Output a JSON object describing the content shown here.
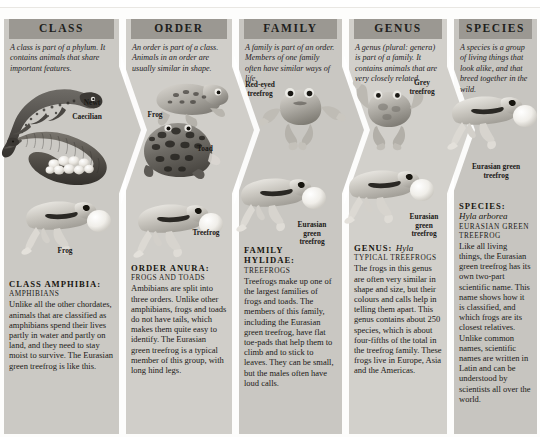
{
  "diagram": {
    "subject": "Eurasian green treefrog",
    "colors": {
      "header_bar": "#9b9892",
      "panel": "#cfcdc8",
      "page": "#fdfdfc",
      "text": "#1b1917"
    }
  },
  "columns": [
    {
      "id": "class",
      "header": "CLASS",
      "intro": "A class is part of a phylum. It contains animals that share important features.",
      "rank_head": "CLASS AMPHIBIA:",
      "common_name": "AMPHIBIANS",
      "scientific_name": "",
      "body": "Unlike all the other chordates, animals that are classified as amphibians spend their lives partly in water and partly on land, and they need to stay moist to survive. The Eurasian green treefrog is like this.",
      "figures": [
        {
          "label": "Newt",
          "kind": "newt-illustration"
        },
        {
          "label": "Caecilian",
          "kind": "caecilian-illustration"
        },
        {
          "label": "Frog",
          "kind": "frog-illustration"
        }
      ]
    },
    {
      "id": "order",
      "header": "ORDER",
      "intro": "An order is part of a class. Animals in an order are usually similar in shape.",
      "rank_head": "ORDER ANURA:",
      "common_name": "FROGS AND TOADS",
      "scientific_name": "",
      "body": "Ambibians are split into three orders. Unlike other amphibians, frogs and toads do not have tails, which makes them quite easy to identify. The Eurasian green treefrog is a typical member of this group, with long hind legs.",
      "figures": [
        {
          "label": "Frog",
          "kind": "frog-illustration"
        },
        {
          "label": "Toad",
          "kind": "toad-illustration"
        },
        {
          "label": "Treefrog",
          "kind": "treefrog-illustration"
        }
      ]
    },
    {
      "id": "family",
      "header": "FAMILY",
      "intro": "A family is part of an order. Members of one family often have similar ways of life.",
      "rank_head": "FAMILY HYLIDAE:",
      "common_name": "TREEFROGS",
      "scientific_name": "",
      "body": "Treefrogs make up one of the largest families of frogs and toads. The members of this family, including the Eurasian green treefrog, have flat toe-pads that help them to climb and to stick to leaves. They can be small, but the males often have loud calls.",
      "figures": [
        {
          "label": "Red-eyed\ntreefrog",
          "kind": "redeyed-treefrog-illustration"
        },
        {
          "label": "Eurasian\ngreen\ntreefrog",
          "kind": "treefrog-illustration"
        }
      ]
    },
    {
      "id": "genus",
      "header": "GENUS",
      "intro": "A genus (plural: genera) is part of a family. It contains animals that are very closely related.",
      "rank_head": "GENUS:",
      "scientific_name": "Hyla",
      "common_name": "TYPICAL TREEFROGS",
      "body": "The frogs in this genus are often very similar in shape and size, but their colours and calls help in telling them apart. This genus contains about 250 species, which is about four-fifths of the total in the treefrog family. These frogs live in Europe, Asia and the Americas.",
      "figures": [
        {
          "label": "Grey\ntreefrog",
          "kind": "grey-treefrog-illustration"
        },
        {
          "label": "Eurasian\ngreen\ntreefrog",
          "kind": "treefrog-illustration"
        }
      ]
    },
    {
      "id": "species",
      "header": "SPECIES",
      "intro": "A species is a group of living things that look alike, and that breed together in the wild.",
      "rank_head": "SPECIES:",
      "scientific_name": "Hyla arborea",
      "common_name": "EURASIAN GREEN TREEFROG",
      "body": "Like all living things, the Eurasian green treefrog has its own two-part scientific name. This name shows how it is classified, and which frogs are its closest relatives. Unlike common names, scientific names are written in Latin and can be understood by scientists all over the world.",
      "figures": [
        {
          "label": "Eurasian green\ntreefrog",
          "kind": "treefrog-illustration"
        }
      ]
    }
  ]
}
